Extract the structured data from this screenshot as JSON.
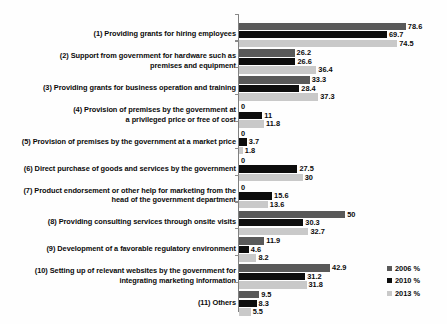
{
  "chart_data": {
    "type": "bar",
    "orientation": "horizontal",
    "title": "",
    "subtitle": "",
    "xlabel": "",
    "ylabel": "",
    "xlim": [
      0,
      80
    ],
    "grid": false,
    "legend_position": "right-bottom",
    "categories": [
      "(1) Providing grants for hiring employees",
      "(2) Support from government for hardware such as\npremises and equipment",
      "(3) Providing grants for business operation and training",
      "(4) Provision of premises by the government at\na privileged price or free of cost",
      "(5) Provision of premises by the government at a market price",
      "(6) Direct purchase of goods and services by the government",
      "(7) Product endorsement or other help for marketing from the\nhead of the government department",
      "(8) Providing consulting services through onsite visits",
      "(9) Development of a favorable regulatory environment",
      "(10) Setting up of relevant websites by the government for\nintegrating marketing information",
      "(11) Others"
    ],
    "series": [
      {
        "name": "2006 %",
        "color": "#595959",
        "values": [
          78.6,
          26.2,
          33.3,
          0,
          0,
          0,
          0,
          50,
          11.9,
          42.9,
          9.5
        ],
        "labels": [
          "78.6",
          "26.2",
          "33.3",
          "0",
          "0",
          "0",
          "0",
          "50",
          "11.9",
          "42.9",
          "9.5"
        ]
      },
      {
        "name": "2010 %",
        "color": "#0d0d0d",
        "values": [
          69.7,
          26.6,
          28.4,
          11,
          3.7,
          27.5,
          15.6,
          30.3,
          4.6,
          31.2,
          8.3
        ],
        "labels": [
          "69.7",
          "26.6",
          "28.4",
          "11",
          "3.7",
          "27.5",
          "15.6",
          "30.3",
          "4.6",
          "31.2",
          "8.3"
        ]
      },
      {
        "name": "2013 %",
        "color": "#c9c9c9",
        "values": [
          74.5,
          36.4,
          37.3,
          11.8,
          1.8,
          30,
          13.6,
          32.7,
          8.2,
          31.8,
          5.5
        ],
        "labels": [
          "74.5",
          "36.4",
          "37.3",
          "11.8",
          "1.8",
          "30",
          "13.6",
          "32.7",
          "8.2",
          "31.8",
          "5.5"
        ]
      }
    ]
  },
  "legend": {
    "items": [
      {
        "label": "2006 %",
        "color": "#595959"
      },
      {
        "label": "2010 %",
        "color": "#0d0d0d"
      },
      {
        "label": "2013 %",
        "color": "#c9c9c9"
      }
    ]
  }
}
